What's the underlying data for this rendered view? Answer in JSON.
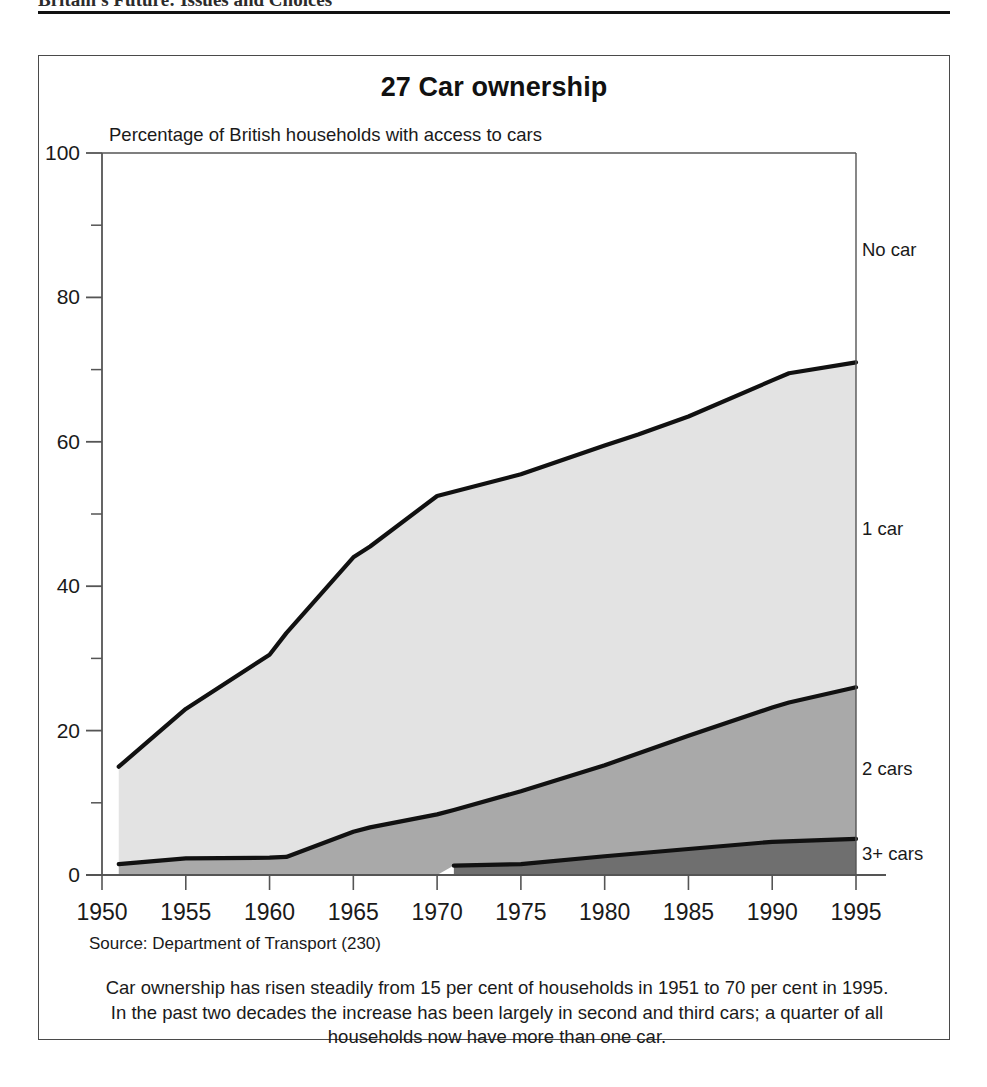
{
  "running_head": {
    "text": "Britain's Future: Issues and Choices"
  },
  "figure": {
    "title": "27 Car ownership",
    "subtitle": "Percentage of British households with access to cars",
    "source": "Source: Department of Transport (230)",
    "caption_line_1": "Car ownership has risen steadily from 15 per cent of households in 1951 to 70 per cent in 1995.",
    "caption_line_2": "In the past two decades the increase has been largely in second and third cars; a quarter of all",
    "caption_line_3": "households now have more than one car."
  },
  "series_labels": {
    "no_car": "No car",
    "one_car": "1 car",
    "two_cars": "2 cars",
    "three_plus_cars": "3+ cars"
  },
  "colors": {
    "one_car_band": "#e3e3e3",
    "two_cars_band": "#a9a9a9",
    "three_plus_band": "#6f6f6f",
    "no_car_band": "#ffffff",
    "line": "#111111",
    "axis": "#555555",
    "frame": "#4a4a4a"
  },
  "chart_data": {
    "type": "area",
    "stacked": true,
    "title": "27 Car ownership",
    "subtitle": "Percentage of British households with access to cars",
    "xlabel": "",
    "ylabel": "Percentage of British households with access to cars",
    "xlim": [
      1950,
      1995
    ],
    "ylim": [
      0,
      100
    ],
    "y_ticks_major": [
      0,
      20,
      40,
      60,
      80,
      100
    ],
    "y_ticks_minor": [
      10,
      30,
      50,
      70,
      90
    ],
    "x_ticks": [
      1950,
      1955,
      1960,
      1965,
      1970,
      1975,
      1980,
      1985,
      1990,
      1995
    ],
    "grid": false,
    "legend_position": "right-inline",
    "note": "Bands are cumulative from the baseline: 3+ cars, then 2 cars, then 1 car. Remainder up to 100 is 'No car'.",
    "series": [
      {
        "name": "3+ cars",
        "stack_order": 1,
        "x": [
          1971,
          1975,
          1980,
          1985,
          1990,
          1995
        ],
        "cumulative_values": [
          1.3,
          1.5,
          2.6,
          3.6,
          4.6,
          5.0
        ]
      },
      {
        "name": "2 cars",
        "stack_order": 2,
        "x": [
          1951,
          1955,
          1960,
          1961,
          1965,
          1966,
          1970,
          1971,
          1975,
          1980,
          1985,
          1990,
          1991,
          1995
        ],
        "cumulative_values": [
          1.5,
          2.3,
          2.4,
          2.5,
          6.0,
          6.6,
          8.4,
          9.0,
          11.6,
          15.2,
          19.3,
          23.2,
          23.9,
          26.0
        ]
      },
      {
        "name": "1 car",
        "stack_order": 3,
        "x": [
          1951,
          1955,
          1960,
          1961,
          1965,
          1966,
          1970,
          1975,
          1980,
          1982,
          1985,
          1990,
          1991,
          1995
        ],
        "cumulative_values": [
          15.0,
          23.0,
          30.5,
          33.5,
          44.0,
          45.5,
          52.5,
          55.5,
          59.5,
          61.0,
          63.5,
          68.5,
          69.5,
          71.0
        ]
      },
      {
        "name": "No car",
        "stack_order": 4,
        "x": [
          1951,
          1995
        ],
        "cumulative_values": [
          100,
          100
        ]
      }
    ],
    "annotations": [
      {
        "label": "No car",
        "year": 1995,
        "value": 87
      },
      {
        "label": "1 car",
        "year": 1995,
        "value": 49
      },
      {
        "label": "2 cars",
        "year": 1995,
        "value": 16
      },
      {
        "label": "3+ cars",
        "year": 1995,
        "value": 2
      }
    ]
  }
}
